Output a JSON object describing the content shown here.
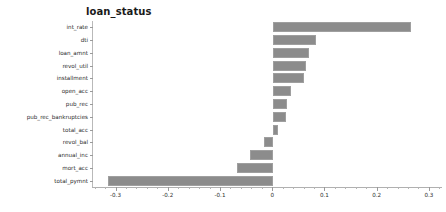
{
  "chart_data": {
    "type": "bar",
    "orientation": "horizontal",
    "title": "loan_status",
    "xlabel": "",
    "ylabel": "",
    "xlim": [
      -0.345,
      0.325
    ],
    "ylim_categories_top_to_bottom": true,
    "grid": false,
    "legend": null,
    "bar_color": "#8c8c8c",
    "bar_edge_color": "#9f9f9f",
    "categories": [
      "int_rate",
      "dti",
      "loan_amnt",
      "revol_util",
      "installment",
      "open_acc",
      "pub_rec",
      "pub_rec_bankruptcies",
      "total_acc",
      "revol_bal",
      "annual_inc",
      "mort_acc",
      "total_pymnt"
    ],
    "values": [
      0.264,
      0.082,
      0.068,
      0.062,
      0.058,
      0.034,
      0.026,
      0.024,
      0.01,
      -0.018,
      -0.044,
      -0.07,
      -0.316
    ],
    "xticks": [
      -0.3,
      -0.2,
      -0.1,
      0,
      0.1,
      0.2,
      0.3
    ],
    "xticklabels": [
      "-0.3",
      "-0.2",
      "-0.1",
      "0",
      "0.1",
      "0.2",
      "0.3"
    ],
    "xtick_minor_step": 0.02
  }
}
